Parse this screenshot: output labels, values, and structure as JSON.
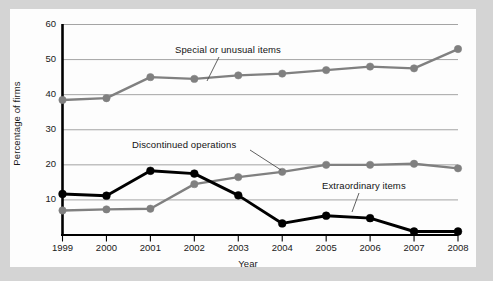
{
  "figure": {
    "panel_background": "#fdfdfd",
    "outer_background": "#d4d4d4",
    "axis_color": "#000000",
    "grid_color": "#9a9a9a"
  },
  "chart_data": {
    "type": "line",
    "title": "",
    "xlabel": "Year",
    "ylabel": "Percentage of firms",
    "x": [
      1999,
      2000,
      2001,
      2002,
      2003,
      2004,
      2005,
      2006,
      2007,
      2008
    ],
    "categories": [
      "1999",
      "2000",
      "2001",
      "2002",
      "2003",
      "2004",
      "2005",
      "2006",
      "2007",
      "2008"
    ],
    "xtick_labels": [
      "1999",
      "2000",
      "2001",
      "2002",
      "2003",
      "2004",
      "2005",
      "2006",
      "2007",
      "2008"
    ],
    "ytick_labels": [
      "10",
      "20",
      "30",
      "40",
      "50",
      "60"
    ],
    "ytick_values": [
      10,
      20,
      30,
      40,
      50,
      60
    ],
    "ylim": [
      0,
      60
    ],
    "xlim": [
      1999,
      2008
    ],
    "grid": "horizontal",
    "legend_position": "inline-annotations",
    "series": [
      {
        "name": "Special or unusual items",
        "color": "#808080",
        "marker": "circle",
        "values": [
          38.5,
          39.0,
          45.0,
          44.5,
          45.5,
          46.0,
          47.0,
          48.0,
          47.5,
          53.0
        ]
      },
      {
        "name": "Discontinued operations",
        "color": "#808080",
        "marker": "circle",
        "values": [
          7.0,
          7.3,
          7.5,
          14.5,
          16.5,
          18.0,
          20.0,
          20.0,
          20.3,
          19.0
        ]
      },
      {
        "name": "Extraordinary items",
        "color": "#000000",
        "marker": "circle",
        "values": [
          11.7,
          11.2,
          18.3,
          17.5,
          11.3,
          3.3,
          5.5,
          4.8,
          1.0,
          1.0
        ]
      }
    ],
    "annotations": [
      {
        "text": "Special or unusual items",
        "series": "Special or unusual items"
      },
      {
        "text": "Discontinued operations",
        "series": "Discontinued operations"
      },
      {
        "text": "Extraordinary items",
        "series": "Extraordinary items"
      }
    ]
  }
}
